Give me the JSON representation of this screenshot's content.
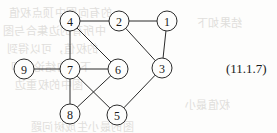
{
  "figure": {
    "equation_label": "(11.1.7)",
    "equation_label_x": 226,
    "equation_label_y": 61,
    "stroke_color": "#2b2b2b",
    "background_color": "#fdfdfc",
    "node_radius": 10
  },
  "graph": {
    "type": "undirected-graph",
    "node_count": 9,
    "edge_count": 12,
    "nodes": [
      {
        "id": "1",
        "label": "1",
        "x": 167,
        "y": 21
      },
      {
        "id": "2",
        "label": "2",
        "x": 119,
        "y": 21
      },
      {
        "id": "3",
        "label": "3",
        "x": 162,
        "y": 68
      },
      {
        "id": "4",
        "label": "4",
        "x": 70,
        "y": 21
      },
      {
        "id": "5",
        "label": "5",
        "x": 117,
        "y": 115
      },
      {
        "id": "6",
        "label": "6",
        "x": 118,
        "y": 69
      },
      {
        "id": "7",
        "label": "7",
        "x": 70,
        "y": 69
      },
      {
        "id": "8",
        "label": "8",
        "x": 70,
        "y": 114
      },
      {
        "id": "9",
        "label": "9",
        "x": 24,
        "y": 69
      }
    ],
    "edges": [
      {
        "from": "4",
        "to": "2"
      },
      {
        "from": "2",
        "to": "1"
      },
      {
        "from": "1",
        "to": "3"
      },
      {
        "from": "2",
        "to": "3"
      },
      {
        "from": "4",
        "to": "7"
      },
      {
        "from": "4",
        "to": "6"
      },
      {
        "from": "9",
        "to": "7"
      },
      {
        "from": "7",
        "to": "6"
      },
      {
        "from": "7",
        "to": "8"
      },
      {
        "from": "7",
        "to": "5"
      },
      {
        "from": "6",
        "to": "8"
      },
      {
        "from": "3",
        "to": "5"
      }
    ]
  },
  "bleed_through": [
    {
      "text": "的有向图中顶点权值",
      "x": 8,
      "y": 4,
      "size": 11
    },
    {
      "text": "中所有的边集合与图",
      "x": 2,
      "y": 22,
      "size": 11
    },
    {
      "text": "的权值，可以得到",
      "x": 6,
      "y": 40,
      "size": 11
    },
    {
      "text": "下面的结论，即",
      "x": 10,
      "y": 58,
      "size": 11
    },
    {
      "text": "图中的权重边",
      "x": 14,
      "y": 76,
      "size": 11
    },
    {
      "text": "图的最小生成树问题",
      "x": 30,
      "y": 118,
      "size": 11
    },
    {
      "text": "权值最小",
      "x": 184,
      "y": 96,
      "size": 11
    },
    {
      "text": "结果如下",
      "x": 196,
      "y": 14,
      "size": 11
    }
  ]
}
